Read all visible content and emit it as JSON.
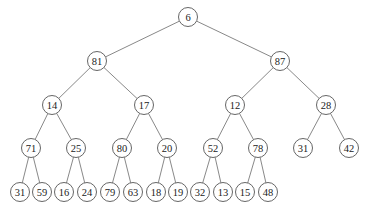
{
  "diagram": {
    "type": "binary-tree",
    "node_radius": 9.5,
    "colors": {
      "edge": "#6a6a6a",
      "node_stroke": "#555555",
      "node_fill": "#ffffff",
      "text": "#222222"
    },
    "nodes": [
      {
        "id": "n0",
        "label": "6",
        "x": 188,
        "y": 17
      },
      {
        "id": "n1",
        "label": "81",
        "x": 97,
        "y": 61
      },
      {
        "id": "n2",
        "label": "87",
        "x": 280,
        "y": 61
      },
      {
        "id": "n3",
        "label": "14",
        "x": 52,
        "y": 105
      },
      {
        "id": "n4",
        "label": "17",
        "x": 144,
        "y": 105
      },
      {
        "id": "n5",
        "label": "12",
        "x": 235,
        "y": 105
      },
      {
        "id": "n6",
        "label": "28",
        "x": 326,
        "y": 105
      },
      {
        "id": "n7",
        "label": "71",
        "x": 31,
        "y": 148
      },
      {
        "id": "n8",
        "label": "25",
        "x": 76,
        "y": 148
      },
      {
        "id": "n9",
        "label": "80",
        "x": 122,
        "y": 148
      },
      {
        "id": "n10",
        "label": "20",
        "x": 167,
        "y": 148
      },
      {
        "id": "n11",
        "label": "52",
        "x": 213,
        "y": 148
      },
      {
        "id": "n12",
        "label": "78",
        "x": 258,
        "y": 148
      },
      {
        "id": "n13",
        "label": "31",
        "x": 303,
        "y": 148
      },
      {
        "id": "n14",
        "label": "42",
        "x": 349,
        "y": 148
      },
      {
        "id": "n15",
        "label": "31",
        "x": 20,
        "y": 192
      },
      {
        "id": "n16",
        "label": "59",
        "x": 42,
        "y": 192
      },
      {
        "id": "n17",
        "label": "16",
        "x": 64,
        "y": 192
      },
      {
        "id": "n18",
        "label": "24",
        "x": 87,
        "y": 192
      },
      {
        "id": "n19",
        "label": "79",
        "x": 110,
        "y": 192
      },
      {
        "id": "n20",
        "label": "63",
        "x": 133,
        "y": 192
      },
      {
        "id": "n21",
        "label": "18",
        "x": 156,
        "y": 192
      },
      {
        "id": "n22",
        "label": "19",
        "x": 178,
        "y": 192
      },
      {
        "id": "n23",
        "label": "32",
        "x": 200,
        "y": 192
      },
      {
        "id": "n24",
        "label": "13",
        "x": 223,
        "y": 192
      },
      {
        "id": "n25",
        "label": "15",
        "x": 245,
        "y": 192
      },
      {
        "id": "n26",
        "label": "48",
        "x": 268,
        "y": 192
      }
    ],
    "edges": [
      [
        "n0",
        "n1"
      ],
      [
        "n0",
        "n2"
      ],
      [
        "n1",
        "n3"
      ],
      [
        "n1",
        "n4"
      ],
      [
        "n2",
        "n5"
      ],
      [
        "n2",
        "n6"
      ],
      [
        "n3",
        "n7"
      ],
      [
        "n3",
        "n8"
      ],
      [
        "n4",
        "n9"
      ],
      [
        "n4",
        "n10"
      ],
      [
        "n5",
        "n11"
      ],
      [
        "n5",
        "n12"
      ],
      [
        "n6",
        "n13"
      ],
      [
        "n6",
        "n14"
      ],
      [
        "n7",
        "n15"
      ],
      [
        "n7",
        "n16"
      ],
      [
        "n8",
        "n17"
      ],
      [
        "n8",
        "n18"
      ],
      [
        "n9",
        "n19"
      ],
      [
        "n9",
        "n20"
      ],
      [
        "n10",
        "n21"
      ],
      [
        "n10",
        "n22"
      ],
      [
        "n11",
        "n23"
      ],
      [
        "n11",
        "n24"
      ],
      [
        "n12",
        "n25"
      ],
      [
        "n12",
        "n26"
      ]
    ]
  }
}
